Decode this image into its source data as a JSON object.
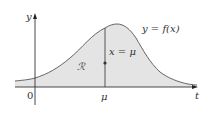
{
  "figure": {
    "axes": {
      "y_label": "y",
      "x_label": "t",
      "origin_label": "0",
      "mu_tick_label": "μ"
    },
    "curve": {
      "label": "y = f(x)",
      "fill_color": "#e4e4e4",
      "stroke_color": "#555555"
    },
    "region": {
      "label": "ℛ"
    },
    "vertical_line": {
      "label": "x = μ",
      "color": "#444444"
    }
  }
}
